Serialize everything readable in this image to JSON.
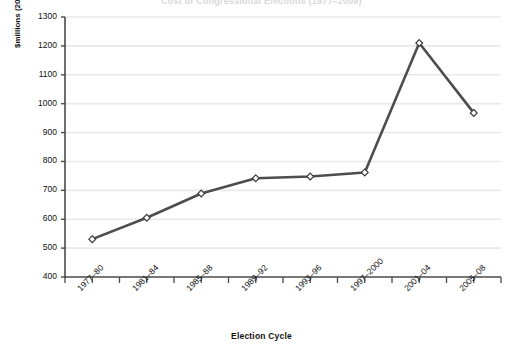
{
  "figure": {
    "title_cropped": "Cost of Congressional Elections (1977–2008)",
    "x_axis_title": "Election Cycle",
    "y_axis_title": "$millions (2006)"
  },
  "chart_data": {
    "type": "line",
    "title": "Cost of Congressional Elections (1977–2008)",
    "xlabel": "Election Cycle",
    "ylabel": "$millions (2006)",
    "categories": [
      "1977–80",
      "1981–84",
      "1985–88",
      "1989–92",
      "1993–96",
      "1997–2000",
      "2001–04",
      "2005–08"
    ],
    "values": [
      531,
      605,
      689,
      742,
      748,
      762,
      1210,
      968
    ],
    "ylim": [
      400,
      1300
    ],
    "ytick_labels": [
      "1300",
      "1200",
      "1100",
      "1000",
      "900",
      "800",
      "700",
      "600",
      "500",
      "400"
    ],
    "ytick_values": [
      1300,
      1200,
      1100,
      1000,
      900,
      800,
      700,
      600,
      500,
      400
    ],
    "grid": "horizontal",
    "legend": "none",
    "series": [
      {
        "name": "Total spending",
        "marker": "diamond",
        "marker_fill": "#ffffff",
        "line_color": "#4d4d4d",
        "values": [
          531,
          605,
          689,
          742,
          748,
          762,
          1210,
          968
        ]
      }
    ],
    "colors": {
      "line": "#4d4d4d",
      "marker_fill": "#ffffff",
      "marker_stroke": "#3b3b3b",
      "grid": "#e9e9e9",
      "axis": "#4a4a4a",
      "background": "#ffffff"
    }
  }
}
